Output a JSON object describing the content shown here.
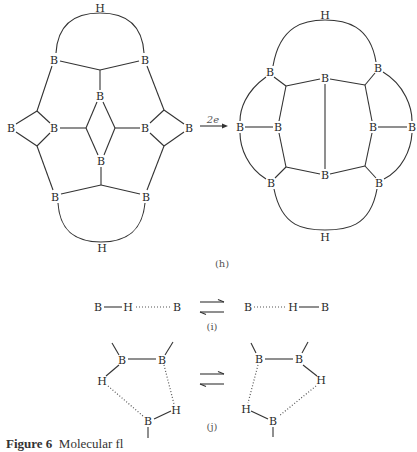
{
  "figure": {
    "caption_label": "Figure 6",
    "caption_text": "Molecular fl"
  },
  "panel_h": {
    "label": "(h)",
    "arrow_label": "2e",
    "left_structure": {
      "h_top": "H",
      "h_bottom": "H",
      "b_top_left": "B",
      "b_top_right": "B",
      "b_center_top": "B",
      "b_center_bottom": "B",
      "b_left_outer": "B",
      "b_left_inner": "B",
      "b_right_inner": "B",
      "b_right_outer": "B",
      "b_bottom_left": "B",
      "b_bottom_right": "B"
    },
    "right_structure": {
      "h_top": "H",
      "h_bottom": "H",
      "b_top_left": "B",
      "b_top_center": "B",
      "b_top_right": "B",
      "b_left_outer": "B",
      "b_left_inner": "B",
      "b_right_inner": "B",
      "b_right_outer": "B",
      "b_bottom_left": "B",
      "b_bottom_center": "B",
      "b_bottom_right": "B"
    }
  },
  "panel_i": {
    "label": "(i)",
    "left": {
      "atom1": "B",
      "atom2": "H",
      "atom3": "B"
    },
    "right": {
      "atom1": "B",
      "atom2": "H",
      "atom3": "B"
    }
  },
  "panel_j": {
    "label": "(j)",
    "left": {
      "b_top_left": "B",
      "b_top_right": "B",
      "h_left": "H",
      "h_right": "H",
      "b_bottom": "B"
    },
    "right": {
      "b_top_left": "B",
      "b_top_right": "B",
      "h_left": "H",
      "h_right": "H",
      "b_bottom": "B"
    }
  }
}
